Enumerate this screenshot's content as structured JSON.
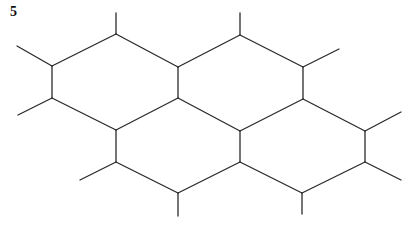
{
  "figure": {
    "label": "5",
    "line_color": "#2a2a2a",
    "vertices": {
      "A": [
        116,
        34
      ],
      "B": [
        52,
        66
      ],
      "C": [
        52,
        98
      ],
      "D": [
        178,
        67
      ],
      "E": [
        178,
        98
      ],
      "F": [
        240,
        35
      ],
      "G": [
        303,
        67
      ],
      "H": [
        303,
        99
      ],
      "I": [
        116,
        130
      ],
      "J": [
        116,
        162
      ],
      "K": [
        178,
        193
      ],
      "L": [
        240,
        131
      ],
      "M": [
        240,
        162
      ],
      "N": [
        302,
        193
      ],
      "O": [
        365,
        131
      ],
      "P": [
        365,
        162
      ]
    },
    "edges": [
      [
        "A",
        "B"
      ],
      [
        "B",
        "C"
      ],
      [
        "C",
        "I"
      ],
      [
        "I",
        "E"
      ],
      [
        "E",
        "D"
      ],
      [
        "D",
        "A"
      ],
      [
        "D",
        "F"
      ],
      [
        "F",
        "G"
      ],
      [
        "G",
        "H"
      ],
      [
        "H",
        "L"
      ],
      [
        "L",
        "E"
      ],
      [
        "I",
        "J"
      ],
      [
        "J",
        "K"
      ],
      [
        "K",
        "M"
      ],
      [
        "M",
        "L"
      ],
      [
        "M",
        "N"
      ],
      [
        "N",
        "P"
      ],
      [
        "P",
        "O"
      ],
      [
        "O",
        "H"
      ]
    ],
    "stubs": [
      [
        [
          116,
          34
        ],
        [
          116,
          13
        ]
      ],
      [
        [
          52,
          66
        ],
        [
          17,
          46
        ]
      ],
      [
        [
          52,
          98
        ],
        [
          18,
          115
        ]
      ],
      [
        [
          240,
          35
        ],
        [
          240,
          13
        ]
      ],
      [
        [
          303,
          67
        ],
        [
          339,
          49
        ]
      ],
      [
        [
          116,
          162
        ],
        [
          80,
          180
        ]
      ],
      [
        [
          178,
          193
        ],
        [
          178,
          216
        ]
      ],
      [
        [
          302,
          193
        ],
        [
          302,
          214
        ]
      ],
      [
        [
          365,
          131
        ],
        [
          401,
          112
        ]
      ],
      [
        [
          365,
          162
        ],
        [
          401,
          180
        ]
      ]
    ]
  }
}
